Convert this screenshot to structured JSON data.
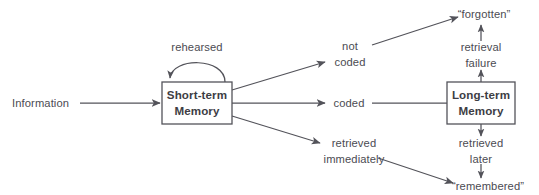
{
  "diagram": {
    "type": "flow-diagram",
    "colors": {
      "stroke": "#53535a",
      "text": "#4b4b52",
      "box_text": "#3d3d44",
      "background": "#ffffff"
    },
    "nodes": [
      {
        "id": "information",
        "kind": "label",
        "label": "Information"
      },
      {
        "id": "short-term-memory",
        "kind": "box",
        "label_line1": "Short-term",
        "label_line2": "Memory"
      },
      {
        "id": "long-term-memory",
        "kind": "box",
        "label_line1": "Long-term",
        "label_line2": "Memory"
      },
      {
        "id": "forgotten",
        "kind": "label",
        "label": "“forgotten”"
      },
      {
        "id": "remembered",
        "kind": "label",
        "label": "“remembered”"
      }
    ],
    "edge_labels": [
      {
        "id": "rehearsed",
        "label": "rehearsed"
      },
      {
        "id": "not-coded",
        "line1": "not",
        "line2": "coded"
      },
      {
        "id": "coded",
        "label": "coded"
      },
      {
        "id": "retrieved-immediately",
        "line1": "retrieved",
        "line2": "immediately"
      },
      {
        "id": "retrieval-failure",
        "line1": "retrieval",
        "line2": "failure"
      },
      {
        "id": "retrieved-later",
        "line1": "retrieved",
        "line2": "later"
      }
    ]
  }
}
